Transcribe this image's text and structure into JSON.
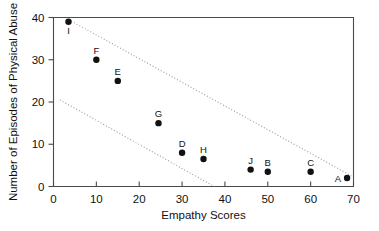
{
  "chart_data": {
    "type": "scatter",
    "title": "",
    "xlabel": "Empathy Scores",
    "ylabel": "Number of Episodes of Physical Abuse",
    "xlim": [
      0,
      70
    ],
    "ylim": [
      0,
      40
    ],
    "xticks": [
      0,
      10,
      20,
      30,
      40,
      50,
      60,
      70
    ],
    "yticks": [
      0,
      10,
      20,
      30,
      40
    ],
    "xtick_labels": [
      "0",
      "10",
      "20",
      "30",
      "40",
      "50",
      "60",
      "70"
    ],
    "ytick_labels": [
      "0",
      "10",
      "20",
      "30",
      "40"
    ],
    "grid": false,
    "legend": "none",
    "points": [
      {
        "label": "I",
        "x": 3.5,
        "y": 39,
        "label_pos": "below"
      },
      {
        "label": "F",
        "x": 10,
        "y": 30,
        "label_pos": "above"
      },
      {
        "label": "E",
        "x": 15,
        "y": 25,
        "label_pos": "above"
      },
      {
        "label": "G",
        "x": 24.5,
        "y": 15,
        "label_pos": "above"
      },
      {
        "label": "D",
        "x": 30,
        "y": 8,
        "label_pos": "above"
      },
      {
        "label": "H",
        "x": 35,
        "y": 6.5,
        "label_pos": "above"
      },
      {
        "label": "J",
        "x": 46,
        "y": 4,
        "label_pos": "above"
      },
      {
        "label": "B",
        "x": 50,
        "y": 3.5,
        "label_pos": "above"
      },
      {
        "label": "C",
        "x": 60,
        "y": 3.5,
        "label_pos": "above"
      },
      {
        "label": "A",
        "x": 68.5,
        "y": 2,
        "label_pos": "left"
      }
    ],
    "annotations": [
      {
        "name": "upper-boundary-line",
        "style": "dotted",
        "from": {
          "x": 3.5,
          "y": 39.5
        },
        "to": {
          "x": 69.5,
          "y": 2.5
        }
      },
      {
        "name": "lower-boundary-line",
        "style": "dotted",
        "from": {
          "x": 1.5,
          "y": 20.5
        },
        "to": {
          "x": 37.5,
          "y": 0
        }
      }
    ]
  }
}
